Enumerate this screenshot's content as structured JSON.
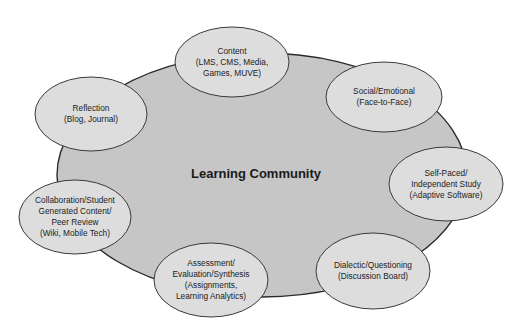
{
  "diagram": {
    "center": {
      "label": "Learning Community",
      "cx": 262,
      "cy": 175,
      "rx": 205,
      "ry": 122
    },
    "nodes": [
      {
        "id": "content",
        "lines": [
          "Content",
          "(LMS, CMS, Media,",
          "Games, MUVE)"
        ],
        "cx": 232,
        "cy": 62,
        "rx": 57,
        "ry": 35
      },
      {
        "id": "social-emotional",
        "lines": [
          "Social/Emotional",
          "(Face-to-Face)"
        ],
        "cx": 384,
        "cy": 97,
        "rx": 58,
        "ry": 35
      },
      {
        "id": "reflection",
        "lines": [
          "Reflection",
          "(Blog, Journal)"
        ],
        "cx": 91,
        "cy": 114,
        "rx": 56,
        "ry": 37
      },
      {
        "id": "self-paced",
        "lines": [
          "Self-Paced/",
          "Independent Study",
          "(Adaptive Software)"
        ],
        "cx": 446,
        "cy": 184,
        "rx": 57,
        "ry": 37
      },
      {
        "id": "collaboration",
        "lines": [
          "Collaboration/Student",
          "Generated Content/",
          "Peer Review",
          "(Wiki, Mobile Tech)"
        ],
        "cx": 75,
        "cy": 217,
        "rx": 56,
        "ry": 37
      },
      {
        "id": "assessment",
        "lines": [
          "Assessment/",
          "Evaluation/Synthesis",
          "(Assignments,",
          "Learning Analytics)"
        ],
        "cx": 211,
        "cy": 280,
        "rx": 57,
        "ry": 37
      },
      {
        "id": "dialectic",
        "lines": [
          "Dialectic/Questioning",
          "(Discussion Board)"
        ],
        "cx": 373,
        "cy": 271,
        "rx": 57,
        "ry": 38
      }
    ],
    "colors": {
      "center_fill": "#c6c6c6",
      "node_fill": "#dddddd",
      "stroke": "#2a2a2a",
      "text": "#222222"
    }
  }
}
